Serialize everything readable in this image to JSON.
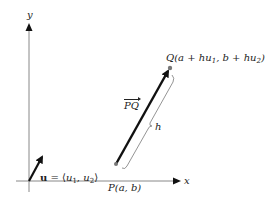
{
  "figure": {
    "axes": {
      "x_label": "x",
      "y_label": "y"
    },
    "unit_vector": {
      "symbol": "u",
      "equals": " = ⟨",
      "comp1": "u",
      "comp1_sub": "1",
      "sep": ", ",
      "comp2": "u",
      "comp2_sub": "2",
      "close": "⟩"
    },
    "point_P": {
      "name": "P",
      "coords": "(a, b)"
    },
    "point_Q": {
      "name": "Q",
      "open": "(a + hu",
      "sub1": "1",
      "mid": ", b + hu",
      "sub2": "2",
      "close": ")"
    },
    "vector_label": "PQ",
    "length_label": "h",
    "colors": {
      "axis": "#888888",
      "vector": "#111111",
      "point": "#777777",
      "brace": "#888888",
      "text": "#222222"
    }
  }
}
